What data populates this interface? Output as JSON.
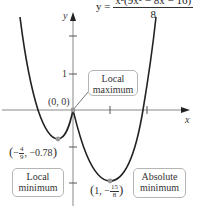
{
  "equation": {
    "lhs": "y =",
    "numerator": "x²(9x² − 8x − 16)",
    "denominator": "8"
  },
  "axes": {
    "x_label": "x",
    "y_label": "y",
    "y_tick_label": "1",
    "x_tick_label": "1"
  },
  "points": [
    {
      "name": "origin",
      "label": "(0, 0)",
      "x": 0,
      "y": 0
    },
    {
      "name": "local-min",
      "label_prefix": "−",
      "label_num": "4",
      "label_den": "9",
      "label_suffix": ", −0.78",
      "x": -0.444,
      "y": -0.78
    },
    {
      "name": "absolute-min",
      "label_prefix": "1, −",
      "label_num": "15",
      "label_den": "8",
      "x": 1,
      "y": -1.875
    }
  ],
  "callouts": {
    "local_max_line1": "Local",
    "local_max_line2": "maximum",
    "local_min_line1": "Local",
    "local_min_line2": "minimum",
    "abs_min_line1": "Absolute",
    "abs_min_line2": "minimum"
  },
  "colors": {
    "curve": "#222222",
    "axis": "#888888",
    "point": "#999999",
    "box_border": "#b5b5b5"
  }
}
